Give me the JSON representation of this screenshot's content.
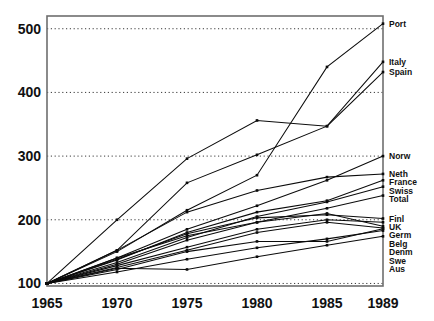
{
  "chart_data": {
    "type": "line",
    "title": "",
    "subtitle": "",
    "xlabel": "",
    "ylabel": "",
    "x": [
      1965,
      1970,
      1975,
      1980,
      1985,
      1989
    ],
    "xtick_labels": [
      "1965",
      "1970",
      "1975",
      "1980",
      "1985",
      "1989"
    ],
    "ytick_labels": [
      "100",
      "200",
      "300",
      "400",
      "500"
    ],
    "yticks": [
      100,
      200,
      300,
      400,
      500
    ],
    "xlim": [
      1965,
      1989
    ],
    "ylim": [
      96,
      520
    ],
    "grid": "horizontal-dotted",
    "legend_position": "right-inline-line-end-labels",
    "markers": "small-square",
    "series": [
      {
        "name": "Port",
        "label": "Port",
        "values": [
          100,
          150,
          215,
          270,
          440,
          508
        ]
      },
      {
        "name": "Italy",
        "label": "Italy",
        "values": [
          100,
          152,
          258,
          302,
          347,
          448
        ]
      },
      {
        "name": "Spain",
        "label": "Spain",
        "values": [
          100,
          200,
          296,
          356,
          347,
          432
        ]
      },
      {
        "name": "Norw",
        "label": "Norw",
        "values": [
          100,
          140,
          185,
          222,
          262,
          300
        ]
      },
      {
        "name": "Neth",
        "label": "Neth",
        "values": [
          100,
          152,
          212,
          246,
          267,
          272
        ]
      },
      {
        "name": "France",
        "label": "France",
        "values": [
          100,
          137,
          180,
          212,
          230,
          262
        ]
      },
      {
        "name": "Swiss",
        "label": "Swiss",
        "values": [
          100,
          133,
          172,
          205,
          228,
          252
        ]
      },
      {
        "name": "Total",
        "label": "Total",
        "values": [
          100,
          130,
          168,
          196,
          218,
          238
        ]
      },
      {
        "name": "Finl",
        "label": "Finl",
        "values": [
          100,
          138,
          178,
          203,
          208,
          202
        ]
      },
      {
        "name": "UK",
        "label": "UK",
        "values": [
          100,
          128,
          157,
          185,
          200,
          196
        ]
      },
      {
        "name": "Germ",
        "label": "Germ",
        "values": [
          100,
          140,
          175,
          196,
          210,
          190
        ]
      },
      {
        "name": "Belg",
        "label": "Belg",
        "values": [
          100,
          125,
          152,
          180,
          196,
          187
        ]
      },
      {
        "name": "Denm",
        "label": "Denm",
        "values": [
          100,
          122,
          150,
          166,
          166,
          186
        ]
      },
      {
        "name": "Swe",
        "label": "Swe",
        "values": [
          100,
          118,
          138,
          156,
          170,
          183
        ]
      },
      {
        "name": "Aus",
        "label": "Aus",
        "values": [
          100,
          124,
          122,
          142,
          160,
          174
        ]
      }
    ]
  },
  "axis": {
    "y_label_color": "#111111",
    "x_label_color": "#111111"
  },
  "style": {
    "line_color": "#0b0b0b",
    "grid_color": "#3a3a3a",
    "frame_color": "#6e6e6e",
    "background": "#ffffff"
  }
}
